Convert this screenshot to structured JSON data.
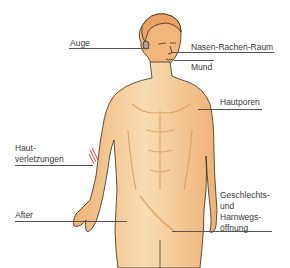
{
  "diagram": {
    "colors": {
      "skin": "#f2c08a",
      "skin_light": "#f8dcb4",
      "skin_shadow": "#e3a468",
      "outline": "#3b2a1a",
      "wound": "#d0453a",
      "line": "#555555",
      "text": "#3a3a3a"
    },
    "labels": {
      "auge": "Auge",
      "nasen_rachen_raum": "Nasen-Rachen-Raum",
      "mund": "Mund",
      "hautporen": "Hautporen",
      "hautverletzungen_1": "Haut-",
      "hautverletzungen_2": "verletzungen",
      "after": "After",
      "geschlechts_1": "Geschlechts-",
      "geschlechts_2": "und",
      "geschlechts_3": "Harnwegs-",
      "geschlechts_4": "öffnung"
    }
  }
}
